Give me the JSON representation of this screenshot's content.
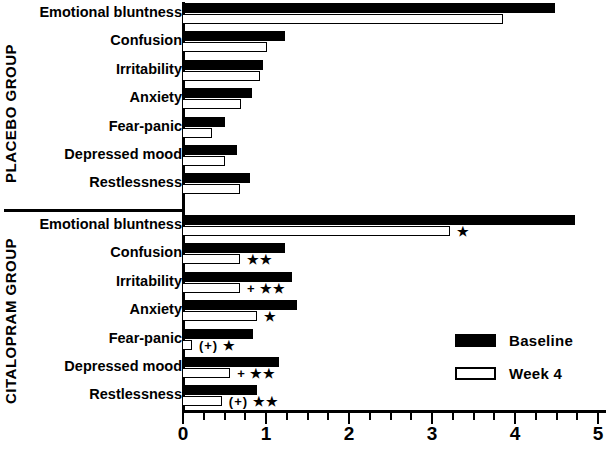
{
  "chart_data": {
    "type": "bar",
    "orientation": "horizontal",
    "title": "",
    "xlabel": "",
    "ylabel": "",
    "xlim": [
      0,
      5
    ],
    "xticks": [
      0,
      1,
      2,
      3,
      4,
      5
    ],
    "xtick_labels": [
      "0",
      "1",
      "2",
      "3",
      "4",
      "5"
    ],
    "minor_tick_step": 0.25,
    "grid": false,
    "legend": {
      "position": "middle-right",
      "entries": [
        {
          "name": "Baseline",
          "style": "filled-black"
        },
        {
          "name": "Week 4",
          "style": "hollow-white"
        }
      ]
    },
    "series": [
      {
        "name": "Baseline",
        "style": "filled-black"
      },
      {
        "name": "Week 4",
        "style": "hollow-white"
      }
    ],
    "groups": [
      {
        "name": "PLACEBO GROUP",
        "categories": [
          "Emotional bluntness",
          "Confusion",
          "Irritability",
          "Anxiety",
          "Fear-panic",
          "Depressed mood",
          "Restlessness"
        ],
        "baseline": [
          4.49,
          1.24,
          0.98,
          0.84,
          0.52,
          0.66,
          0.82
        ],
        "week4": [
          3.87,
          1.02,
          0.94,
          0.71,
          0.36,
          0.52,
          0.7
        ],
        "significance": [
          "",
          "",
          "",
          "",
          "",
          "",
          ""
        ]
      },
      {
        "name": "CITALOPRAM GROUP",
        "categories": [
          "Emotional bluntness",
          "Confusion",
          "Irritability",
          "Anxiety",
          "Fear-panic",
          "Depressed mood",
          "Restlessness"
        ],
        "baseline": [
          4.73,
          1.24,
          1.33,
          1.39,
          0.86,
          1.17,
          0.9
        ],
        "week4": [
          3.23,
          0.7,
          0.7,
          0.9,
          0.12,
          0.58,
          0.48
        ],
        "significance": [
          "★",
          "★★",
          "+ ★★",
          "★",
          "(+) ★",
          "+ ★★",
          "(+) ★★"
        ]
      }
    ]
  },
  "legend": {
    "baseline_label": "Baseline",
    "week4_label": "Week 4"
  },
  "groups": {
    "placebo_label": "PLACEBO GROUP",
    "citalopram_label": "CITALOPRAM GROUP"
  },
  "axis": {
    "labels": [
      "0",
      "1",
      "2",
      "3",
      "4",
      "5"
    ]
  }
}
